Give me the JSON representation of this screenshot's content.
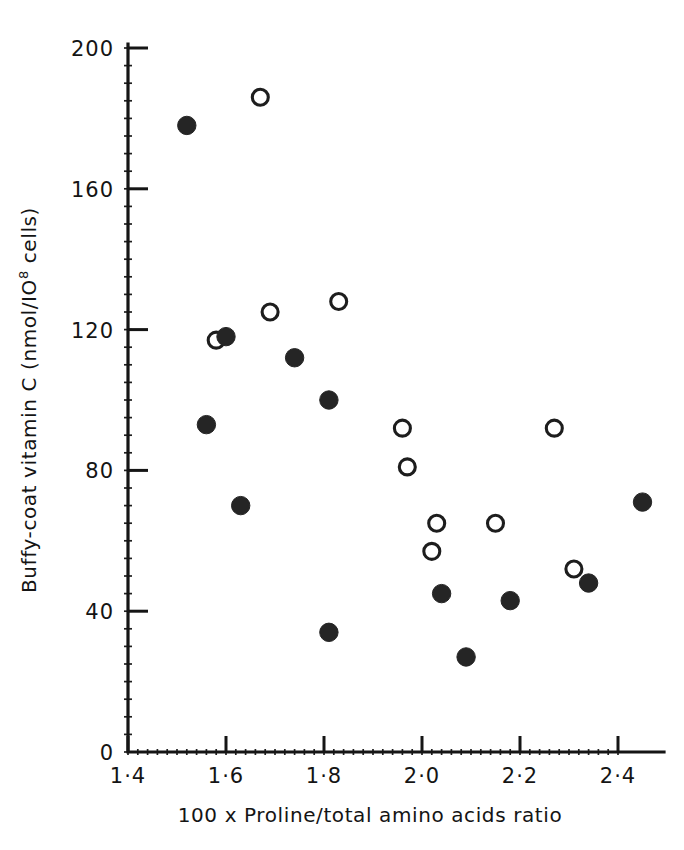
{
  "chart_data": {
    "type": "scatter",
    "title": "",
    "xlabel": "100 x Proline/total amino acids ratio",
    "ylabel": "Buffy-coat vitamin C (nmol/10⁸ cells)",
    "ylabel_parts": {
      "main": "Buffy-coat vitamin C (nmol/IO",
      "exponent": "8",
      "tail": " cells)"
    },
    "xlim": [
      1.4,
      2.5
    ],
    "ylim": [
      0,
      200
    ],
    "xticks": [
      1.4,
      1.6,
      1.8,
      2.0,
      2.2,
      2.4
    ],
    "xticklabels": [
      "1·4",
      "1·6",
      "1·8",
      "2·0",
      "2·2",
      "2·4"
    ],
    "yticks": [
      0,
      40,
      80,
      120,
      160,
      200
    ],
    "yticklabels": [
      "0",
      "40",
      "80",
      "120",
      "160",
      "200"
    ],
    "x_minor_interval": 0.02,
    "y_minor_interval": 5,
    "grid": false,
    "legend": "none",
    "series": [
      {
        "name": "filled",
        "marker": "filled-circle",
        "color": "#252525",
        "points": [
          {
            "x": 1.52,
            "y": 178
          },
          {
            "x": 1.56,
            "y": 93
          },
          {
            "x": 1.6,
            "y": 118
          },
          {
            "x": 1.63,
            "y": 70
          },
          {
            "x": 1.74,
            "y": 112
          },
          {
            "x": 1.81,
            "y": 100
          },
          {
            "x": 1.81,
            "y": 34
          },
          {
            "x": 2.04,
            "y": 45
          },
          {
            "x": 2.09,
            "y": 27
          },
          {
            "x": 2.18,
            "y": 43
          },
          {
            "x": 2.34,
            "y": 48
          },
          {
            "x": 2.45,
            "y": 71
          }
        ]
      },
      {
        "name": "open",
        "marker": "open-circle",
        "color": "#1d1d1d",
        "points": [
          {
            "x": 1.58,
            "y": 117
          },
          {
            "x": 1.67,
            "y": 186
          },
          {
            "x": 1.69,
            "y": 125
          },
          {
            "x": 1.83,
            "y": 128
          },
          {
            "x": 1.96,
            "y": 92
          },
          {
            "x": 1.97,
            "y": 81
          },
          {
            "x": 2.03,
            "y": 65
          },
          {
            "x": 2.02,
            "y": 57
          },
          {
            "x": 2.15,
            "y": 65
          },
          {
            "x": 2.27,
            "y": 92
          },
          {
            "x": 2.31,
            "y": 52
          }
        ]
      }
    ]
  }
}
